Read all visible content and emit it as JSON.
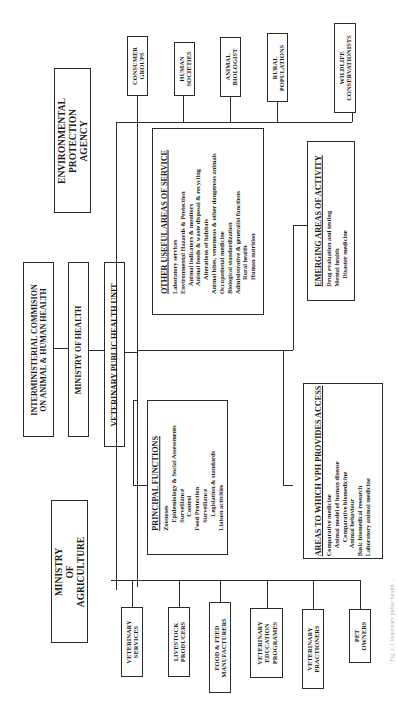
{
  "top_agencies": {
    "environmental": "ENVIRONMENTAL\nPROTECTION\nAGENCY",
    "interministerial": "INTERMINISTERIAL COMMISION\nON ANIMAL & HUMAN HEALTH",
    "ministry_health": "MINISTRY OF HEALTH",
    "vph_unit": "VETERINARY PUBLIC HEALTH UNIT",
    "ministry_agriculture": "MINISTRY\nOF\nAGRICULTURE"
  },
  "top_stakeholders": [
    "CONSUMER\nGROUPS",
    "HUMAN\nSOCIETIES",
    "ANIMAL\nBIOLOGIST",
    "RURAL\nPOPULATIONS",
    "WILDLIFE\nCONSERVATIONISTS"
  ],
  "bottom_stakeholders": [
    "VETERINARY\nSERVICES",
    "LIVESTOCK\nPRODUCERS",
    "FOOD & FEED\nMANUFACTURERS",
    "VETERINARY\nEDUCATION\nPROGRAMES",
    "VETERINARY\nPRACTIONERS",
    "PET\nOWNERS"
  ],
  "other_useful": {
    "title": "OTHER USEFUL AREAS OF SERVICE",
    "items": [
      {
        "text": "Laboratory services",
        "indent": 0
      },
      {
        "text": "Environmental Hazards & Protection",
        "indent": 0
      },
      {
        "text": "Animal indicators & monitors",
        "indent": 1
      },
      {
        "text": "Animal foods & waste disposal & recycling",
        "indent": 1
      },
      {
        "text": "Alterations of habitats",
        "indent": 2
      },
      {
        "text": "Animal bites, venomous & other dangerous animals",
        "indent": 0
      },
      {
        "text": "Occupational medicine",
        "indent": 0
      },
      {
        "text": "Biological standardization",
        "indent": 0
      },
      {
        "text": "Administrative & generalist functions",
        "indent": 0
      },
      {
        "text": "Rural health",
        "indent": 2
      },
      {
        "text": "Human nutrition",
        "indent": 2
      }
    ]
  },
  "emerging": {
    "title": "EMERGING AREAS OF ACTIVITY",
    "items": [
      {
        "text": "Drug evaluation and testing",
        "indent": 0
      },
      {
        "text": "Mental health",
        "indent": 0
      },
      {
        "text": "Disaster medicine",
        "indent": 1
      }
    ]
  },
  "principal": {
    "title": "PRINCIPAL FUNCTIONS",
    "items": [
      {
        "text": "Zoonoses",
        "indent": 0
      },
      {
        "text": "Epidemiology & Social Assessments",
        "indent": 1
      },
      {
        "text": "Surveillance",
        "indent": 1
      },
      {
        "text": "Control",
        "indent": 2
      },
      {
        "text": "Food Protection",
        "indent": 0
      },
      {
        "text": "Surveillance",
        "indent": 1
      },
      {
        "text": "Legislation & standards",
        "indent": 2
      },
      {
        "text": "Liaison activities",
        "indent": 0
      }
    ]
  },
  "access": {
    "title": "AREAS TO WHICH VPH PROVIDES ACCESS",
    "items": [
      {
        "text": "Comparative medicine",
        "indent": 0
      },
      {
        "text": "Animal model of human disease",
        "indent": 1
      },
      {
        "text": "Comparative biomedicine",
        "indent": 2
      },
      {
        "text": "Animal behaviour",
        "indent": 1
      },
      {
        "text": "Basic biomedical research",
        "indent": 0
      },
      {
        "text": "Laboratory animal medicine",
        "indent": 0
      }
    ]
  },
  "caption": "Fig. 1.1 Veterinary public health ..."
}
